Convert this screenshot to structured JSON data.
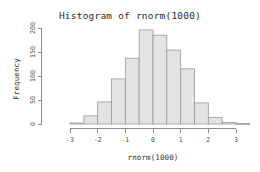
{
  "chart_data": {
    "type": "bar",
    "title": "Histogram of rnorm(1000)",
    "xlabel": "rnorm(1000)",
    "ylabel": "Frequency",
    "grid": false,
    "legend": "none",
    "xlim": [
      -3.25,
      3.5
    ],
    "ylim": [
      0,
      205
    ],
    "bin_width": 0.5,
    "xticks": [
      "-3",
      "-2",
      "-1",
      "0",
      "1",
      "2",
      "3"
    ],
    "xtick_values": [
      -3,
      -2,
      -1,
      0,
      1,
      2,
      3
    ],
    "yticks": [
      "0",
      "50",
      "100",
      "150",
      "200"
    ],
    "ytick_values": [
      0,
      50,
      100,
      150,
      200
    ],
    "bin_edges": [
      -3.0,
      -2.5,
      -2.0,
      -1.5,
      -1.0,
      -0.5,
      0.0,
      0.5,
      1.0,
      1.5,
      2.0,
      2.5,
      3.0,
      3.5
    ],
    "categories": [
      "[-3.0,-2.5)",
      "[-2.5,-2.0)",
      "[-2.0,-1.5)",
      "[-1.5,-1.0)",
      "[-1.0,-0.5)",
      "[-0.5,0.0)",
      "[0.0,0.5)",
      "[0.5,1.0)",
      "[1.0,1.5)",
      "[1.5,2.0)",
      "[2.0,2.5)",
      "[2.5,3.0)",
      "[3.0,3.5)"
    ],
    "values": [
      2,
      17,
      46,
      94,
      137,
      196,
      185,
      154,
      115,
      44,
      14,
      3,
      1
    ],
    "bar_fill_color": "#e3e3e3",
    "bar_border_color": "#9a9a9a",
    "axis_color": "#808080",
    "text_color": "#2b2b2b"
  }
}
